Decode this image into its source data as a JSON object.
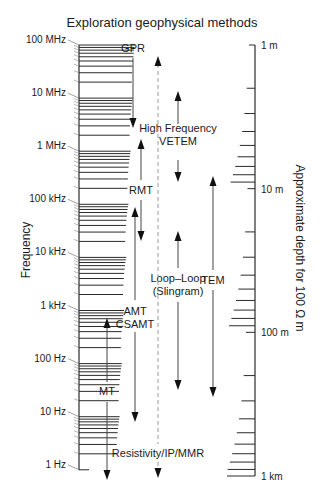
{
  "title": "Exploration geophysical methods",
  "left_axis": {
    "title": "Frequency",
    "x": 79,
    "y_top": 45,
    "y_bottom": 470,
    "px_per_decade": 53.1,
    "labels": [
      "100 MHz",
      "10 MHz",
      "1 MHz",
      "100 kHz",
      "10 kHz",
      "1 kHz",
      "100 Hz",
      "10 Hz",
      "1 Hz"
    ]
  },
  "right_axis": {
    "title": "Approximate depth for 100 Ω m",
    "x": 255,
    "y_top": 45,
    "y_bottom": 476,
    "labels": [
      "1 m",
      "10 m",
      "100 m",
      "1 km"
    ]
  },
  "methods": [
    {
      "name": "GPR",
      "label_lines": [
        "GPR"
      ],
      "label_x": 133,
      "label_y": 52,
      "x": 133,
      "y1": 58,
      "y2": 128,
      "heads": "down",
      "style": "solid"
    },
    {
      "name": "High Frequency VETEM",
      "label_lines": [
        "High Frequency",
        "VETEM"
      ],
      "label_x": 178,
      "label_y": 132,
      "x": 178,
      "y1": 91,
      "y2": 182,
      "heads": "both-split",
      "gap": [
        124,
        160
      ],
      "style": "solid"
    },
    {
      "name": "RMT",
      "label_lines": [
        "RMT"
      ],
      "label_x": 141,
      "label_y": 194,
      "x": 141,
      "y1": 139,
      "y2": 241,
      "heads": "both-split",
      "gap": [
        180,
        200
      ],
      "style": "solid"
    },
    {
      "name": "Loop-Loop (Slingram)",
      "label_lines": [
        "Loop–Loop",
        "(Slingram)"
      ],
      "label_x": 178,
      "label_y": 282,
      "x": 178,
      "y1": 231,
      "y2": 390,
      "heads": "both-split",
      "gap": [
        268,
        302
      ],
      "style": "solid"
    },
    {
      "name": "TEM",
      "label_lines": [
        "TEM"
      ],
      "label_x": 213,
      "label_y": 284,
      "x": 213,
      "y1": 176,
      "y2": 397,
      "heads": "both-split",
      "gap": [
        270,
        290
      ],
      "style": "solid"
    },
    {
      "name": "AMT CSAMT",
      "label_lines": [
        "AMT",
        "CSAMT"
      ],
      "label_x": 135,
      "label_y": 315,
      "x": 135,
      "y1": 207,
      "y2": 422,
      "heads": "both-split",
      "gap": [
        300,
        332
      ],
      "style": "solid"
    },
    {
      "name": "MT",
      "label_lines": [
        "MT"
      ],
      "label_x": 107,
      "label_y": 395,
      "x": 107,
      "y1": 318,
      "y2": 480,
      "heads": "both-split",
      "gap": [
        382,
        402
      ],
      "style": "solid"
    },
    {
      "name": "Resistivity/IP/MMR",
      "label_lines": [
        "Resistivity/IP/MMR"
      ],
      "label_x": 158,
      "label_y": 457,
      "x": 158,
      "y1": 56,
      "y2": 478,
      "heads": "both-split",
      "gap": [
        444,
        462
      ],
      "style": "dashed"
    }
  ],
  "colors": {
    "ink": "#1a1a1a",
    "tick": "#2a2a2a",
    "dashed": "#9a9a9a",
    "arrow": "#444444"
  }
}
